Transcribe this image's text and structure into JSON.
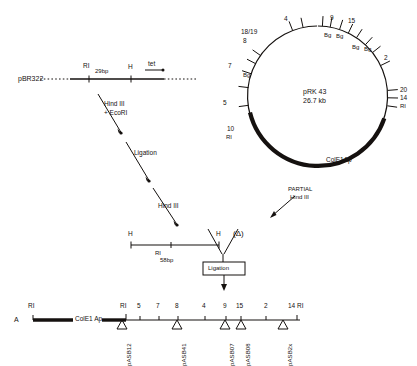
{
  "figure": {
    "panel_letter": "A"
  },
  "pbr322_map": {
    "name": "pBR322",
    "sites": [
      {
        "label": "RI",
        "x": 88
      },
      {
        "label": "H",
        "x": 130
      },
      {
        "label": "tet",
        "x": 152
      }
    ],
    "span_label": "29bp"
  },
  "steps": [
    {
      "id": "digest",
      "line1": "Hind III",
      "line2": "+ EcoRI"
    },
    {
      "id": "ligation-1",
      "label": "Ligation"
    },
    {
      "id": "hind3",
      "label": "Hind III"
    },
    {
      "id": "ligation-2",
      "label": "Ligation"
    },
    {
      "id": "partial",
      "line1": "PARTIAL",
      "line2": "Hind III"
    }
  ],
  "fragment": {
    "left_site": "H",
    "right_site": "H",
    "inner_site": "RI",
    "size": "58bp",
    "delta_label": "(Δ)"
  },
  "plasmid_circle": {
    "name": "pRK 43",
    "size": "26.7 kb",
    "region_label": "ColE1Ap",
    "markers": [
      {
        "label": "4",
        "angle": -78
      },
      {
        "label": "9",
        "angle": -52
      },
      {
        "label": "15",
        "angle": -40
      },
      {
        "label": "2",
        "angle": -20
      },
      {
        "label": "18/19",
        "angle": -118
      },
      {
        "label": "8",
        "angle": -126
      },
      {
        "label": "7",
        "angle": -150
      },
      {
        "label": "5",
        "angle": -183
      },
      {
        "label": "10",
        "angle": -200
      },
      {
        "label": "20",
        "angle": -5
      },
      {
        "label": "14",
        "angle": 2
      }
    ],
    "bg_labels": [
      "Bg",
      "Bg",
      "Bg",
      "Bg",
      "Bg"
    ],
    "ri_labels": [
      "RI",
      "RI"
    ]
  },
  "linear_map": {
    "panel": "A",
    "left_site": "RI",
    "region_label": "ColE1 Ap",
    "second_site": "RI",
    "tick_labels": [
      "5",
      "7",
      "8",
      "4",
      "9",
      "15",
      "2"
    ],
    "right_site": "14 RI",
    "insertions": [
      {
        "name": "pASB12",
        "x": 122
      },
      {
        "name": "pASB41",
        "x": 177
      },
      {
        "name": "pASB07",
        "x": 225
      },
      {
        "name": "pASB08",
        "x": 241
      },
      {
        "name": "pASB2x",
        "x": 283
      }
    ]
  }
}
